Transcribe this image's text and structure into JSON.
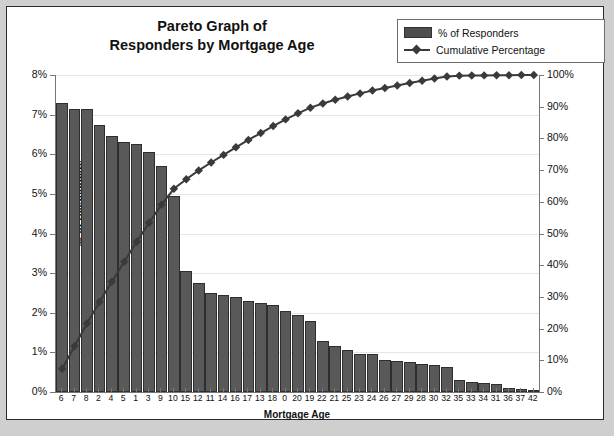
{
  "chart_data": {
    "type": "bar",
    "title": "Pareto Graph of Responders by Mortgage Age",
    "title_line1": "Pareto Graph of",
    "title_line2": "Responders by Mortgage Age",
    "xlabel": "Mortgage  Age",
    "ylabel": "% of Responders",
    "y2label": "Cumulative Percentage",
    "ylim": [
      0,
      8
    ],
    "y2lim": [
      0,
      100
    ],
    "grid": true,
    "legend_position": "top-right",
    "legend": [
      "% of Responders",
      "Cumulative Percentage"
    ],
    "ytick_labels": [
      "0%",
      "1%",
      "2%",
      "3%",
      "4%",
      "5%",
      "6%",
      "7%",
      "8%"
    ],
    "ytick_values": [
      0,
      1,
      2,
      3,
      4,
      5,
      6,
      7,
      8
    ],
    "y2tick_labels": [
      "0%",
      "10%",
      "20%",
      "30%",
      "40%",
      "50%",
      "60%",
      "70%",
      "80%",
      "90%",
      "100%"
    ],
    "y2tick_values": [
      0,
      10,
      20,
      30,
      40,
      50,
      60,
      70,
      80,
      90,
      100
    ],
    "categories": [
      "6",
      "7",
      "8",
      "2",
      "4",
      "5",
      "1",
      "3",
      "9",
      "10",
      "15",
      "12",
      "11",
      "14",
      "16",
      "17",
      "13",
      "18",
      "0",
      "20",
      "19",
      "22",
      "21",
      "25",
      "23",
      "24",
      "26",
      "27",
      "29",
      "28",
      "30",
      "32",
      "35",
      "33",
      "34",
      "31",
      "36",
      "37",
      "42"
    ],
    "series": [
      {
        "name": "% of Responders",
        "type": "bar",
        "color": "#595959",
        "values": [
          7.3,
          7.15,
          7.15,
          6.75,
          6.45,
          6.3,
          6.25,
          6.05,
          5.7,
          4.95,
          3.05,
          2.75,
          2.5,
          2.45,
          2.4,
          2.3,
          2.25,
          2.2,
          2.05,
          1.95,
          1.8,
          1.3,
          1.15,
          1.05,
          0.95,
          0.95,
          0.82,
          0.78,
          0.75,
          0.7,
          0.68,
          0.62,
          0.3,
          0.25,
          0.22,
          0.2,
          0.1,
          0.07,
          0.05
        ]
      },
      {
        "name": "Cumulative Percentage",
        "type": "line",
        "color": "#3a3a3a",
        "marker": "diamond",
        "values": [
          7.3,
          14.5,
          21.6,
          28.4,
          34.8,
          41.1,
          47.4,
          53.4,
          59.1,
          64.1,
          67.1,
          69.9,
          72.4,
          74.8,
          77.2,
          79.5,
          81.7,
          83.9,
          86.0,
          87.9,
          89.7,
          91.0,
          92.2,
          93.2,
          94.2,
          95.1,
          95.9,
          96.7,
          97.5,
          98.2,
          98.9,
          99.5,
          99.8,
          99.85,
          99.88,
          99.9,
          99.95,
          99.98,
          100.0
        ]
      }
    ]
  }
}
